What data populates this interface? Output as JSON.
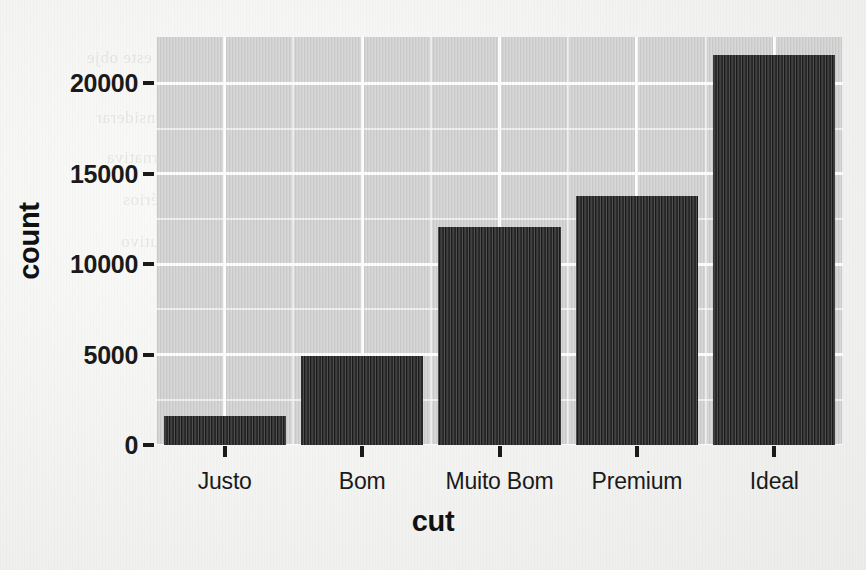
{
  "chart_data": {
    "type": "bar",
    "title": "",
    "xlabel": "cut",
    "ylabel": "count",
    "categories": [
      "Justo",
      "Bom",
      "Muito Bom",
      "Premium",
      "Ideal"
    ],
    "values": [
      1610,
      4906,
      12082,
      13791,
      21551
    ],
    "series": [
      {
        "name": "count",
        "values": [
          1610,
          4906,
          12082,
          13791,
          21551
        ]
      }
    ],
    "ylim": [
      0,
      22563
    ],
    "y_ticks": [
      0,
      5000,
      10000,
      15000,
      20000
    ],
    "y_tick_labels": [
      "0",
      "5000",
      "10000",
      "15000",
      "20000"
    ],
    "y_minor_ticks": [
      2500,
      7500,
      12500,
      17500
    ],
    "x_tick_labels": [
      "Justo",
      "Bom",
      "Muito Bom",
      "Premium",
      "Ideal"
    ],
    "grid": true,
    "grid_color": "#ffffff",
    "legend": null,
    "legend_position": "none",
    "bar_color": "#222222",
    "panel_background": "#d0d0d0",
    "page_background": "#f4f4f2",
    "annotations": []
  },
  "axes": {
    "x_title": "cut",
    "y_title": "count"
  },
  "scan_artifacts": {
    "bleed_lines": [
      "ativamente, este obje",
      "s devemos considerar",
      "ção vs alternativa",
      "s dos critérios",
      "grupo consecutivo"
    ]
  }
}
